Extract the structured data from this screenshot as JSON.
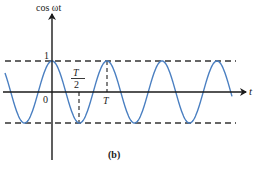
{
  "figure": {
    "y_axis_label": "cos ωt",
    "x_axis_label": "t",
    "caption": "(b)",
    "tick_labels": {
      "peak": "1",
      "origin": "0",
      "half_period_numerator": "T",
      "half_period_denominator": "2",
      "period": "T"
    },
    "colors": {
      "curve": "#4a7fc1",
      "axes": "#1a1a1a",
      "dashed": "#333333"
    },
    "curve": {
      "function": "cos(ωt)",
      "amplitude": 1,
      "cycles_shown": 4
    }
  }
}
